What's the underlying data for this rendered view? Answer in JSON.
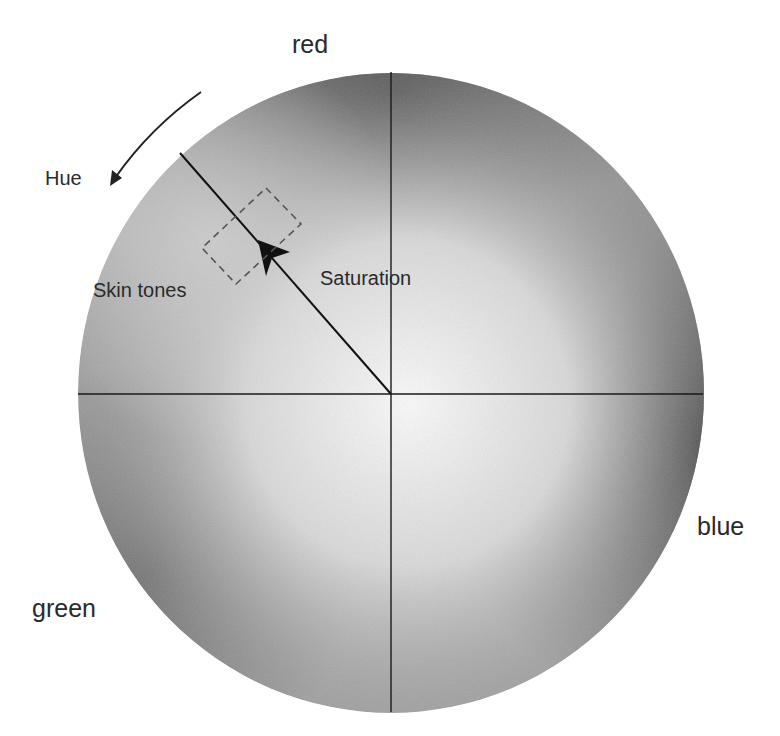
{
  "diagram": {
    "type": "vectorscope-color-wheel",
    "labels": {
      "red": "red",
      "blue": "blue",
      "green": "green",
      "hue": "Hue",
      "saturation": "Saturation",
      "skin_tones": "Skin tones"
    },
    "wheel": {
      "cx": 391,
      "cy": 393,
      "rx": 313,
      "ry": 320
    },
    "colors": {
      "line": "#1a1a1a",
      "dark": "#3d3d3d",
      "mid": "#8a8a8a",
      "light": "#e6e6e6",
      "text": "#2a2a2a"
    }
  }
}
